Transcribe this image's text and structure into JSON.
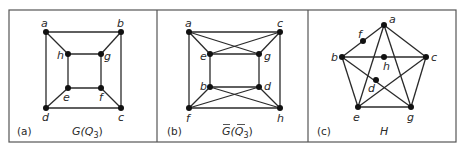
{
  "figure": {
    "panels": [
      {
        "id": "a",
        "tag": "(a)",
        "caption": "G(Q",
        "caption_sub": "3",
        "caption_close": ")",
        "vertices": {
          "a": [
            46,
            32
          ],
          "b": [
            121,
            32
          ],
          "h": [
            68,
            54
          ],
          "g": [
            101,
            54
          ],
          "e": [
            68,
            88
          ],
          "f": [
            101,
            88
          ],
          "d": [
            46,
            108
          ],
          "c": [
            121,
            108
          ]
        },
        "edges": [
          [
            "a",
            "b"
          ],
          [
            "b",
            "c"
          ],
          [
            "c",
            "d"
          ],
          [
            "d",
            "a"
          ],
          [
            "h",
            "g"
          ],
          [
            "g",
            "f"
          ],
          [
            "f",
            "e"
          ],
          [
            "e",
            "h"
          ],
          [
            "a",
            "h"
          ],
          [
            "b",
            "g"
          ],
          [
            "c",
            "f"
          ],
          [
            "d",
            "e"
          ]
        ]
      },
      {
        "id": "b",
        "tag": "(b)",
        "caption": "G(Q",
        "caption_sub": "3",
        "caption_close": ")",
        "caption_overlines": true,
        "vertices": {
          "a": [
            189,
            32
          ],
          "c": [
            280,
            32
          ],
          "e": [
            210,
            54
          ],
          "g": [
            259,
            54
          ],
          "b": [
            210,
            87
          ],
          "d": [
            259,
            87
          ],
          "f": [
            189,
            108
          ],
          "h": [
            280,
            108
          ]
        },
        "edges": [
          [
            "a",
            "c"
          ],
          [
            "c",
            "h"
          ],
          [
            "h",
            "f"
          ],
          [
            "f",
            "a"
          ],
          [
            "e",
            "g"
          ],
          [
            "g",
            "d"
          ],
          [
            "d",
            "b"
          ],
          [
            "b",
            "e"
          ],
          [
            "a",
            "e"
          ],
          [
            "a",
            "g"
          ],
          [
            "c",
            "e"
          ],
          [
            "c",
            "g"
          ],
          [
            "f",
            "b"
          ],
          [
            "f",
            "d"
          ],
          [
            "h",
            "b"
          ],
          [
            "h",
            "d"
          ]
        ],
        "crossing_hops": [
          [
            234.5,
            43
          ],
          [
            234.5,
            98
          ]
        ]
      },
      {
        "id": "c",
        "tag": "(c)",
        "caption": "H",
        "vertices": {
          "a": [
            384,
            25
          ],
          "b": [
            342,
            57
          ],
          "c": [
            426,
            57
          ],
          "h": [
            384,
            57
          ],
          "f": [
            363,
            41
          ],
          "d": [
            376,
            80
          ],
          "e": [
            358,
            107
          ],
          "g": [
            411,
            107
          ]
        },
        "edges": [
          [
            "a",
            "b"
          ],
          [
            "a",
            "c"
          ],
          [
            "a",
            "e"
          ],
          [
            "a",
            "g"
          ],
          [
            "b",
            "c"
          ],
          [
            "b",
            "e"
          ],
          [
            "b",
            "g"
          ],
          [
            "c",
            "e"
          ],
          [
            "c",
            "g"
          ],
          [
            "e",
            "g"
          ]
        ]
      }
    ]
  }
}
